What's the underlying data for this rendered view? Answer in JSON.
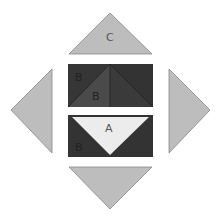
{
  "diagram": {
    "colors": {
      "background": "#ffffff",
      "light_gray": "#bdbdbd",
      "medium_dark": "#4a4a4a",
      "dark": "#333333",
      "very_light": "#ececec",
      "outline": "#888888",
      "label_dark": "#222222",
      "label_light": "#555555"
    },
    "pieces": [
      {
        "id": "top-triangle",
        "label": "C",
        "shape": "triangle",
        "color": "light_gray"
      },
      {
        "id": "left-triangle",
        "label": "",
        "shape": "triangle",
        "color": "light_gray"
      },
      {
        "id": "right-triangle",
        "label": "",
        "shape": "triangle",
        "color": "light_gray"
      },
      {
        "id": "bottom-triangle",
        "label": "",
        "shape": "triangle",
        "color": "light_gray"
      },
      {
        "id": "upper-rect-left-corner",
        "label": "B",
        "shape": "triangle",
        "color": "dark"
      },
      {
        "id": "upper-rect-left-mid",
        "label": "B",
        "shape": "triangle",
        "color": "medium_dark"
      },
      {
        "id": "upper-rect-right-mid",
        "label": "",
        "shape": "triangle",
        "color": "dark"
      },
      {
        "id": "upper-rect-right-corner",
        "label": "",
        "shape": "triangle",
        "color": "dark"
      },
      {
        "id": "lower-rect-center",
        "label": "A",
        "shape": "triangle",
        "color": "very_light"
      },
      {
        "id": "lower-rect-left-corner",
        "label": "B",
        "shape": "triangle",
        "color": "dark"
      },
      {
        "id": "lower-rect-right-corner",
        "label": "",
        "shape": "triangle",
        "color": "dark"
      }
    ],
    "labels": {
      "c": "C",
      "b_upper_corner": "B",
      "b_upper_mid": "B",
      "a": "A",
      "b_lower_corner": "B"
    }
  }
}
